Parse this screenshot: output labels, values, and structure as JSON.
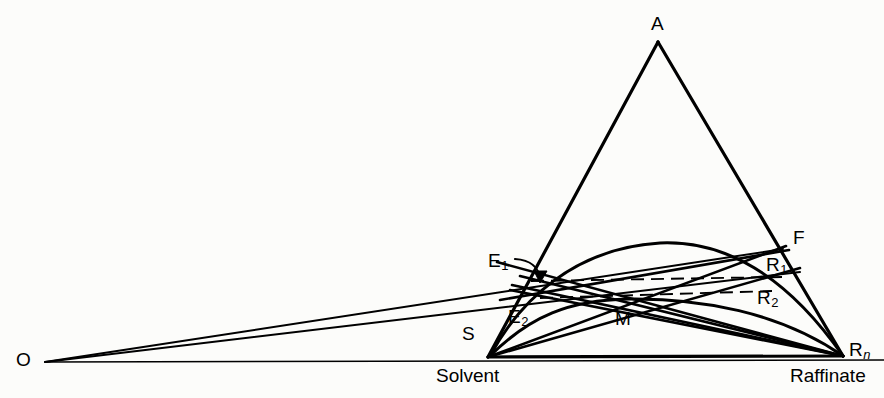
{
  "figure": {
    "type": "ternary-phase-extraction-diagram",
    "background_color": "#fcfcfa",
    "line_color": "#000000",
    "width": 884,
    "height": 398
  },
  "labels": {
    "apex_a": "A",
    "feed_f": "F",
    "extract_1": "E",
    "extract_1_sub": "1",
    "extract_2": "E",
    "extract_2_sub": "2",
    "raffinate_1": "R",
    "raffinate_1_sub": "1",
    "raffinate_2": "R",
    "raffinate_2_sub": "2",
    "raffinate_n": "R",
    "raffinate_n_sub": "n",
    "mixture_m": "M",
    "solvent_s": "S",
    "operating_point_o": "O",
    "solvent_caption": "Solvent",
    "raffinate_caption": "Raffinate"
  },
  "geometry": {
    "points": {
      "A": [
        658,
        42
      ],
      "S": [
        488,
        357
      ],
      "Rn": [
        843,
        356
      ],
      "O": [
        45,
        362
      ],
      "F": [
        783,
        249
      ],
      "E1": [
        533,
        282
      ],
      "E2": [
        541,
        299
      ],
      "R1": [
        774,
        276
      ],
      "R2": [
        756,
        293
      ],
      "M": [
        620,
        300
      ]
    },
    "binodal_peak": [
      657,
      243
    ],
    "tie_lines": [
      {
        "name": "tie-line-1",
        "from": "E1",
        "to": "R1",
        "style": "dashed"
      },
      {
        "name": "tie-line-2",
        "from": "E2",
        "to": "R2",
        "style": "dashed"
      }
    ]
  }
}
